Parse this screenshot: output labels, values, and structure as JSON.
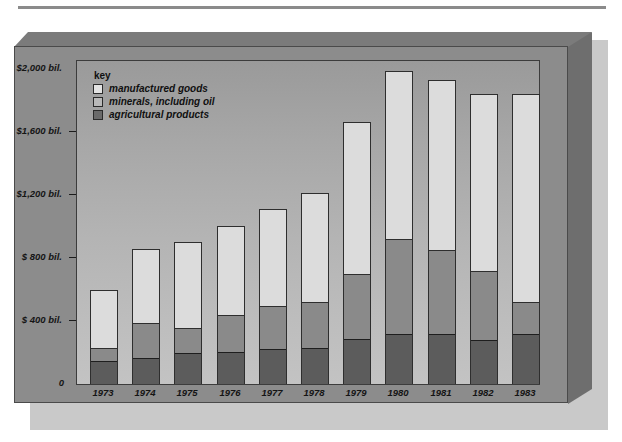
{
  "chart_data": {
    "type": "bar",
    "subtype": "stacked-vertical",
    "title": "",
    "xlabel": "",
    "ylabel": "",
    "categories": [
      "1973",
      "1974",
      "1975",
      "1976",
      "1977",
      "1978",
      "1979",
      "1980",
      "1981",
      "1982",
      "1983"
    ],
    "series": [
      {
        "name": "agricultural products",
        "color": "#5c5c5c",
        "values": [
          150,
          165,
          195,
          205,
          225,
          230,
          290,
          320,
          320,
          280,
          320
        ]
      },
      {
        "name": "minerals, including oil",
        "color": "#8a8a8a",
        "values": [
          80,
          225,
          160,
          235,
          270,
          295,
          410,
          600,
          535,
          440,
          200
        ]
      },
      {
        "name": "manufactured goods",
        "color": "#dcdcdc",
        "values": [
          365,
          465,
          545,
          560,
          615,
          685,
          965,
          1065,
          1075,
          1120,
          1320
        ]
      }
    ],
    "totals": [
      595,
      855,
      900,
      1000,
      1110,
      1210,
      1665,
      1985,
      1930,
      1840,
      1840
    ],
    "ylim": [
      0,
      2000
    ],
    "yticks": [
      0,
      400,
      800,
      1200,
      1600,
      2000
    ],
    "ytick_labels": [
      "0",
      "$ 400 bil.",
      "$ 800 bil.",
      "$1,200 bil.",
      "$1,600 bil.",
      "$2,000 bil."
    ],
    "grid": false,
    "legend_position": "top-left"
  },
  "legend": {
    "title": "key",
    "items": [
      {
        "label": "manufactured goods",
        "color": "#dcdcdc"
      },
      {
        "label": "minerals, including oil",
        "color": "#b8b8b8"
      },
      {
        "label": "agricultural products",
        "color": "#6a6a6a"
      }
    ]
  }
}
